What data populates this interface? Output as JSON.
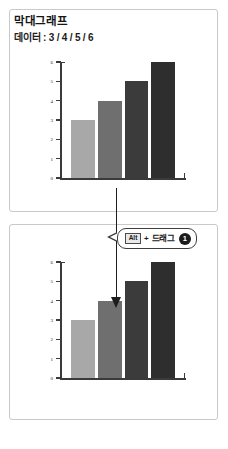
{
  "header": {
    "title": "막대그래프",
    "subtitle": "데이터 : 3 / 4 / 5 / 6"
  },
  "callout": {
    "keycap_label": "Alt",
    "plus": "+",
    "action_label": "드래그",
    "step_number": "1"
  },
  "icons": {
    "down_arrow": "down-arrow-icon"
  },
  "chart_data": [
    {
      "type": "bar",
      "title": "막대그래프",
      "categories": [
        "1",
        "2",
        "3",
        "4"
      ],
      "values": [
        3,
        4,
        5,
        6
      ],
      "bar_colors": [
        "#a8a8a8",
        "#6f6f6f",
        "#3b3b3b",
        "#2e2e2e"
      ],
      "ylim": [
        0,
        6
      ],
      "yticks": [
        0,
        1,
        2,
        3,
        4,
        5,
        6
      ],
      "ytick_labels": [
        "0",
        "1",
        "2",
        "3",
        "4",
        "5",
        "6"
      ],
      "xlabel": "",
      "ylabel": "",
      "grid": false,
      "legend": false
    },
    {
      "type": "bar",
      "title": "막대그래프",
      "categories": [
        "1",
        "2",
        "3",
        "4"
      ],
      "values": [
        3,
        4,
        5,
        6
      ],
      "bar_colors": [
        "#a8a8a8",
        "#6f6f6f",
        "#3b3b3b",
        "#2e2e2e"
      ],
      "ylim": [
        0,
        6
      ],
      "yticks": [
        0,
        1,
        2,
        3,
        4,
        5,
        6
      ],
      "ytick_labels": [
        "0",
        "1",
        "2",
        "3",
        "4",
        "5",
        "6"
      ],
      "xlabel": "",
      "ylabel": "",
      "grid": false,
      "legend": false
    }
  ]
}
